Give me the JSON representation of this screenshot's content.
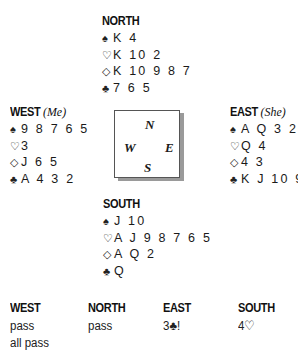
{
  "hands": {
    "north": {
      "label": "NORTH",
      "note": "",
      "spades": "K 4",
      "hearts": "K 10 2",
      "diamonds": "K 10 9 8 7",
      "clubs": "7 6 5"
    },
    "west": {
      "label": "WEST",
      "note": "(Me)",
      "spades": "9 8 7 6 5",
      "hearts": "3",
      "diamonds": "J 6 5",
      "clubs": "A 4 3 2"
    },
    "east": {
      "label": "EAST",
      "note": "(She)",
      "spades": "A Q 3 2",
      "hearts": "Q 4",
      "diamonds": "4 3",
      "clubs": "K J 10 9 8"
    },
    "south": {
      "label": "SOUTH",
      "note": "",
      "spades": "J 10",
      "hearts": "A J 9 8 7 6 5",
      "diamonds": "A Q 2",
      "clubs": "Q"
    }
  },
  "suit_symbols": {
    "spades": "♠",
    "hearts": "♡",
    "diamonds": "◇",
    "clubs": "♣"
  },
  "compass": {
    "n": "N",
    "w": "W",
    "e": "E",
    "s": "S"
  },
  "auction": {
    "headers": [
      "WEST",
      "NORTH",
      "EAST",
      "SOUTH"
    ],
    "columns": {
      "west": [
        "pass",
        "all pass"
      ],
      "north": [
        "pass"
      ],
      "east": [
        "3♣!"
      ],
      "south": [
        "4♡"
      ]
    }
  }
}
